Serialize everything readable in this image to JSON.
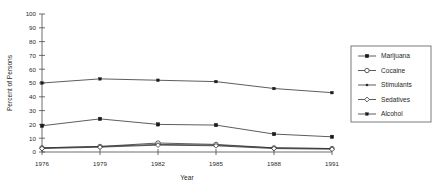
{
  "chart_data": {
    "type": "line",
    "title": "",
    "xlabel": "Year",
    "ylabel": "Percent of Persons",
    "categories": [
      1976,
      1979,
      1982,
      1985,
      1988,
      1991
    ],
    "xtick_labels": [
      "1976",
      "1979",
      "1982",
      "1985",
      "1988",
      "1991"
    ],
    "ytick_labels": [
      "0",
      "10",
      "20",
      "30",
      "40",
      "50",
      "60",
      "70",
      "80",
      "90",
      "100"
    ],
    "ylim": [
      0,
      100
    ],
    "ytick_step": 10,
    "grid": false,
    "legend_position": "right",
    "series": [
      {
        "name": "Marijuana",
        "marker": "filled-square",
        "values": [
          19,
          24,
          20,
          19.5,
          13,
          11
        ]
      },
      {
        "name": "Cocaine",
        "marker": "open-circle",
        "values": [
          3,
          4,
          6.5,
          5.5,
          3,
          2.5
        ]
      },
      {
        "name": "Stimulants",
        "marker": "small-dot",
        "values": [
          3,
          4,
          5.5,
          5,
          3,
          2.5
        ]
      },
      {
        "name": "Sedatives",
        "marker": "open-diamond",
        "values": [
          2.5,
          3.5,
          5,
          4.5,
          2.5,
          2
        ]
      },
      {
        "name": "Alcohol",
        "marker": "small-filled-square",
        "values": [
          50,
          53,
          52,
          51,
          46,
          43
        ]
      }
    ]
  },
  "legend": {
    "entries": [
      {
        "label": "Marijuana"
      },
      {
        "label": "Cocaine"
      },
      {
        "label": "Stimulants"
      },
      {
        "label": "Sedatives"
      },
      {
        "label": "Alcohol"
      }
    ]
  },
  "colors": {
    "line": "#333333",
    "axis": "#4a4a4a",
    "text": "#1f1f1f",
    "background": "#ffffff"
  }
}
